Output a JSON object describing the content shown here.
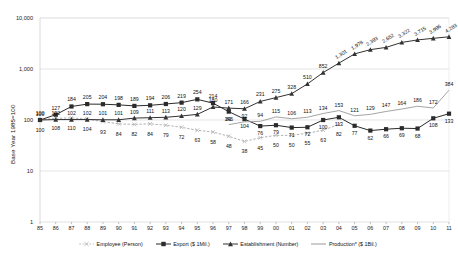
{
  "chart_data": {
    "type": "line",
    "title": "",
    "subtitle": "",
    "xlabel": "",
    "ylabel": "Base Year 1985=100",
    "yscale": "log",
    "ylim": [
      1,
      10000
    ],
    "ytick_labels": [
      "10,000",
      "1,000",
      "100",
      "10",
      "1"
    ],
    "ytick_values": [
      10000,
      1000,
      100,
      10,
      1
    ],
    "grid": true,
    "legend_position": "bottom",
    "categories": [
      "85",
      "86",
      "87",
      "88",
      "89",
      "90",
      "91",
      "92",
      "93",
      "94",
      "95",
      "96",
      "97",
      "98",
      "99",
      "00",
      "01",
      "02",
      "03",
      "04",
      "05",
      "06",
      "07",
      "08",
      "09",
      "10",
      "11"
    ],
    "series": [
      {
        "name": "Employee (Person)",
        "marker": "cross",
        "color": "#b0b0b0",
        "values": [
          100,
          108,
          110,
          104,
          93,
          84,
          82,
          84,
          79,
          72,
          63,
          58,
          48,
          38,
          45,
          50,
          50,
          55,
          63,
          82,
          null,
          null,
          null,
          null,
          null,
          null,
          null
        ],
        "labels": [
          "100",
          "108",
          "110",
          "104",
          "93",
          "84",
          "82",
          "84",
          "79",
          "72",
          "63",
          "58",
          "48",
          "38",
          "45",
          "50",
          "50",
          "55",
          "63",
          "82",
          "",
          "",
          "",
          "",
          "",
          "",
          ""
        ]
      },
      {
        "name": "Export ($ 1Mil.)",
        "marker": "square",
        "color": "#2b2b2b",
        "values": [
          100,
          127,
          184,
          205,
          204,
          198,
          189,
          194,
          206,
          219,
          254,
          214,
          146,
          104,
          76,
          79,
          71,
          72,
          100,
          113,
          77,
          62,
          66,
          69,
          68,
          108,
          133
        ],
        "labels": [
          "100",
          "127",
          "184",
          "205",
          "204",
          "198",
          "189",
          "194",
          "206",
          "219",
          "254",
          "214",
          "146",
          "104",
          "76",
          "79",
          "71",
          "72",
          "100",
          "113",
          "77",
          "62",
          "66",
          "69",
          "68",
          "108",
          "133"
        ]
      },
      {
        "name": "Establishment (Number)",
        "marker": "triangle",
        "color": "#333333",
        "values": [
          100,
          102,
          102,
          102,
          101,
          101,
          109,
          111,
          113,
          120,
          129,
          180,
          171,
          166,
          231,
          275,
          328,
          510,
          852,
          1301,
          1978,
          2393,
          2652,
          3322,
          3715,
          3996,
          4283
        ],
        "labels": [
          "100",
          "102",
          "102",
          "102",
          "101",
          "101",
          "109",
          "111",
          "113",
          "120",
          "129",
          "180",
          "171",
          "166",
          "231",
          "275",
          "328",
          "510",
          "852",
          "1,301",
          "1,978",
          "2,393",
          "2,652",
          "3,322",
          "3,715",
          "3,996",
          "4,283"
        ]
      },
      {
        "name": "Production* ($ 1Bil.)",
        "marker": "line",
        "color": "#9a9a9a",
        "values": [
          null,
          null,
          null,
          null,
          null,
          null,
          null,
          null,
          null,
          null,
          null,
          null,
          81,
          92,
          94,
          115,
          106,
          113,
          134,
          153,
          121,
          129,
          147,
          164,
          186,
          172,
          384
        ],
        "labels": [
          "",
          "",
          "",
          "",
          "",
          "",
          "",
          "",
          "",
          "",
          "",
          "",
          "81",
          "92",
          "94",
          "115",
          "106",
          "113",
          "134",
          "153",
          "121",
          "129",
          "147",
          "164",
          "186",
          "172",
          "384"
        ]
      }
    ]
  }
}
